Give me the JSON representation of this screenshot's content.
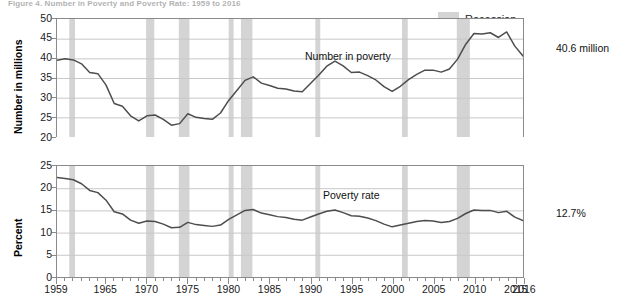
{
  "figure": {
    "title": "Figure 4. Number in Poverty and Poverty Rate: 1959 to 2016",
    "legend": {
      "recession_label": "Recession",
      "recession_color": "#d4d4d4"
    },
    "line_color": "#4d4d4d",
    "axis_color": "#8a8a8a",
    "grid_color": "#c8c8c8"
  },
  "panels": {
    "top": {
      "series_label": "Number in poverty",
      "end_value_label": "40.6 million",
      "ylabel": "Number in millions",
      "yticks": [
        50,
        45,
        40,
        35,
        30,
        25,
        20
      ]
    },
    "bottom": {
      "series_label": "Poverty rate",
      "end_value_label": "12.7%",
      "ylabel": "Percent",
      "yticks": [
        25,
        20,
        15,
        10,
        5,
        0
      ]
    }
  },
  "xaxis": {
    "labels": [
      "1959",
      "1965",
      "1970",
      "1975",
      "1980",
      "1985",
      "1990",
      "1995",
      "2000",
      "2005",
      "2010",
      "2015",
      "2016"
    ],
    "label_years": [
      1959,
      1965,
      1970,
      1975,
      1980,
      1985,
      1990,
      1995,
      2000,
      2005,
      2010,
      2015,
      2016
    ],
    "min": 1959,
    "max": 2016
  },
  "chart_data": {
    "type": "line",
    "title": "Figure 4. Number in Poverty and Poverty Rate: 1959 to 2016",
    "xlabel": "",
    "panels": [
      {
        "name": "Number in poverty",
        "ylabel": "Number in millions",
        "ylim": [
          20,
          50
        ],
        "yticks": [
          20,
          25,
          30,
          35,
          40,
          45,
          50
        ],
        "grid": true,
        "annotation": "40.6 million",
        "x": [
          1959,
          1960,
          1961,
          1962,
          1963,
          1964,
          1965,
          1966,
          1967,
          1968,
          1969,
          1970,
          1971,
          1972,
          1973,
          1974,
          1975,
          1976,
          1977,
          1978,
          1979,
          1980,
          1981,
          1982,
          1983,
          1984,
          1985,
          1986,
          1987,
          1988,
          1989,
          1990,
          1991,
          1992,
          1993,
          1994,
          1995,
          1996,
          1997,
          1998,
          1999,
          2000,
          2001,
          2002,
          2003,
          2004,
          2005,
          2006,
          2007,
          2008,
          2009,
          2010,
          2011,
          2012,
          2013,
          2014,
          2015,
          2016
        ],
        "values": [
          39.5,
          39.9,
          39.6,
          38.6,
          36.4,
          36.1,
          33.2,
          28.5,
          27.8,
          25.4,
          24.1,
          25.4,
          25.6,
          24.5,
          23.0,
          23.4,
          25.9,
          25.0,
          24.7,
          24.5,
          26.1,
          29.3,
          31.8,
          34.4,
          35.3,
          33.7,
          33.1,
          32.4,
          32.2,
          31.7,
          31.5,
          33.6,
          35.7,
          38.0,
          39.3,
          38.1,
          36.4,
          36.5,
          35.6,
          34.5,
          32.8,
          31.6,
          32.9,
          34.6,
          35.9,
          37.0,
          37.0,
          36.5,
          37.3,
          39.8,
          43.6,
          46.3,
          46.2,
          46.5,
          45.3,
          46.7,
          43.1,
          40.6
        ]
      },
      {
        "name": "Poverty rate",
        "ylabel": "Percent",
        "ylim": [
          0,
          25
        ],
        "yticks": [
          0,
          5,
          10,
          15,
          20,
          25
        ],
        "grid": true,
        "annotation": "12.7%",
        "x": [
          1959,
          1960,
          1961,
          1962,
          1963,
          1964,
          1965,
          1966,
          1967,
          1968,
          1969,
          1970,
          1971,
          1972,
          1973,
          1974,
          1975,
          1976,
          1977,
          1978,
          1979,
          1980,
          1981,
          1982,
          1983,
          1984,
          1985,
          1986,
          1987,
          1988,
          1989,
          1990,
          1991,
          1992,
          1993,
          1994,
          1995,
          1996,
          1997,
          1998,
          1999,
          2000,
          2001,
          2002,
          2003,
          2004,
          2005,
          2006,
          2007,
          2008,
          2009,
          2010,
          2011,
          2012,
          2013,
          2014,
          2015,
          2016
        ],
        "values": [
          22.4,
          22.2,
          21.9,
          21.0,
          19.5,
          19.0,
          17.3,
          14.7,
          14.2,
          12.8,
          12.1,
          12.6,
          12.5,
          11.9,
          11.1,
          11.2,
          12.3,
          11.8,
          11.6,
          11.4,
          11.7,
          13.0,
          14.0,
          15.0,
          15.2,
          14.4,
          14.0,
          13.6,
          13.4,
          13.0,
          12.8,
          13.5,
          14.2,
          14.8,
          15.1,
          14.5,
          13.8,
          13.7,
          13.3,
          12.7,
          11.9,
          11.3,
          11.7,
          12.1,
          12.5,
          12.7,
          12.6,
          12.3,
          12.5,
          13.2,
          14.3,
          15.1,
          15.0,
          15.0,
          14.5,
          14.8,
          13.5,
          12.7
        ]
      }
    ],
    "recessions": [
      {
        "start": 1960.5,
        "end": 1961.2
      },
      {
        "start": 1969.9,
        "end": 1970.9
      },
      {
        "start": 1973.9,
        "end": 1975.2
      },
      {
        "start": 1980.0,
        "end": 1980.6
      },
      {
        "start": 1981.5,
        "end": 1982.9
      },
      {
        "start": 1990.6,
        "end": 1991.2
      },
      {
        "start": 2001.2,
        "end": 2001.9
      },
      {
        "start": 2007.9,
        "end": 2009.5
      }
    ]
  }
}
